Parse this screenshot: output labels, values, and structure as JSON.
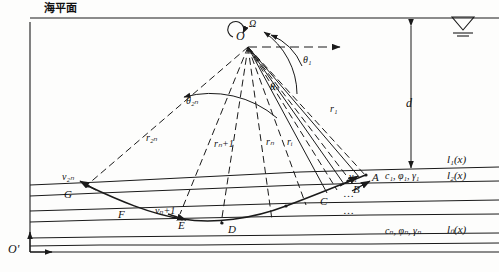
{
  "figure": {
    "title": "海平面",
    "type": "seismic ray-path diagram through layered seabed strata"
  },
  "labels": {
    "sea_level": "海平面",
    "origin_O": "O",
    "omega": "Ω",
    "origin_Oprime": "O'",
    "depth_d": "d",
    "theta_1": "θ₁",
    "theta_n": "θₙ",
    "theta_2n": "θ₂ₙ",
    "r_1": "r₁",
    "r_i": "rᵢ",
    "r_n": "rₙ",
    "r_n_plus_1": "rₙ+1",
    "r_2n": "r₂ₙ",
    "v_1": "v₁",
    "v_n_plus_1": "vₙ+1",
    "v_2n": "v₂ₙ",
    "point_A": "A",
    "point_B": "B",
    "point_C": "C",
    "point_D": "D",
    "point_E": "E",
    "point_F": "F",
    "point_G": "G",
    "layer_l1": "l₁(x)",
    "layer_l2": "l₂(x)",
    "layer_ln": "lₙ(x)",
    "params_layer1": "c₁,  φ₁,  γ₁",
    "params_layern": "cₙ,  φₙ,  γₙ",
    "ellipsis_upper": "…",
    "ellipsis_lower": "…"
  },
  "colors": {
    "line": "#1a1a1a",
    "text": "#111111",
    "background": "#fdfdfc"
  }
}
